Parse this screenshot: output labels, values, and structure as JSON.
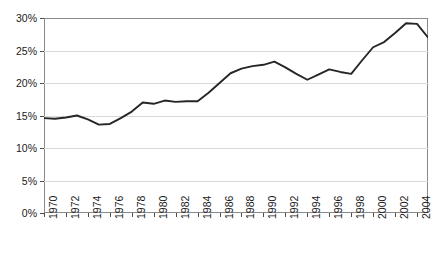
{
  "chart_data": {
    "type": "line",
    "title": "",
    "subtitle": "",
    "xlabel": "",
    "ylabel": "",
    "xlim": [
      1970,
      2005
    ],
    "ylim": [
      0,
      30
    ],
    "grid": true,
    "legend": "none",
    "y_tick_labels": [
      "30%",
      "25%",
      "20%",
      "15%",
      "10%",
      "5%",
      "0%"
    ],
    "y_ticks": [
      30,
      25,
      20,
      15,
      10,
      5,
      0
    ],
    "x_tick_labels": [
      "1970",
      "1972",
      "1974",
      "1976",
      "1978",
      "1980",
      "1982",
      "1984",
      "1986",
      "1988",
      "1990",
      "1992",
      "1994",
      "1996",
      "1998",
      "2000",
      "2002",
      "2004"
    ],
    "x_ticks": [
      1970,
      1972,
      1974,
      1976,
      1978,
      1980,
      1982,
      1984,
      1986,
      1988,
      1990,
      1992,
      1994,
      1996,
      1998,
      2000,
      2002,
      2004
    ],
    "line_color": "#262626",
    "grid_color": "#d9d9d9",
    "axis_color": "#8a8a8a",
    "x": [
      1970,
      1971,
      1972,
      1973,
      1974,
      1975,
      1976,
      1977,
      1978,
      1979,
      1980,
      1981,
      1982,
      1983,
      1984,
      1985,
      1986,
      1987,
      1988,
      1989,
      1990,
      1991,
      1992,
      1993,
      1994,
      1995,
      1996,
      1997,
      1998,
      1999,
      2000,
      2001,
      2002,
      2003,
      2004,
      2005
    ],
    "values": [
      14.6,
      14.5,
      14.7,
      15.0,
      14.4,
      13.6,
      13.7,
      14.6,
      15.6,
      17.0,
      16.8,
      17.3,
      17.1,
      17.2,
      17.2,
      18.5,
      20.0,
      21.5,
      22.2,
      22.6,
      22.8,
      23.3,
      22.4,
      21.4,
      20.5,
      21.3,
      22.1,
      21.7,
      21.4,
      23.5,
      25.5,
      26.3,
      27.7,
      29.2,
      29.1,
      27.0
    ],
    "series_name": "Share of total (%)"
  }
}
